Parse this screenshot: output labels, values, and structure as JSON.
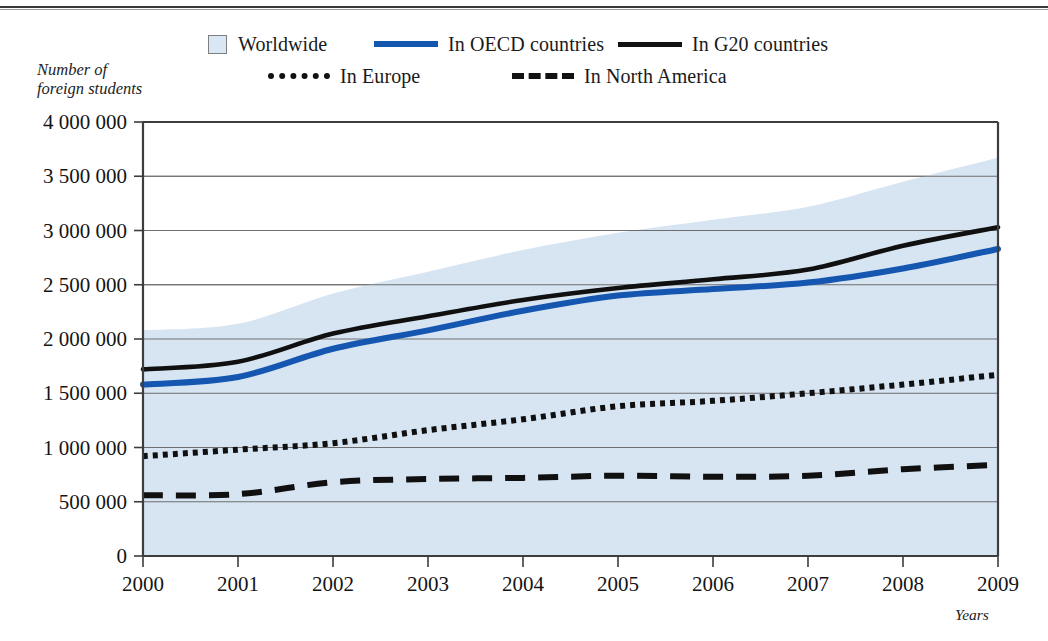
{
  "chart_data": {
    "type": "line",
    "title": "",
    "subtitle": "",
    "xlabel": "Years",
    "ylabel": "Number of\nforeign students",
    "ylabel_line1": "Number of",
    "ylabel_line2": "foreign students",
    "x": [
      2000,
      2001,
      2002,
      2003,
      2004,
      2005,
      2006,
      2007,
      2008,
      2009
    ],
    "xtick_labels": [
      "2000",
      "2001",
      "2002",
      "2003",
      "2004",
      "2005",
      "2006",
      "2007",
      "2008",
      "2009"
    ],
    "ylim": [
      0,
      4000000
    ],
    "ytick_values": [
      0,
      500000,
      1000000,
      1500000,
      2000000,
      2500000,
      3000000,
      3500000,
      4000000
    ],
    "ytick_labels": [
      "0",
      "500 000",
      "1 000 000",
      "1 500 000",
      "2 000 000",
      "2 500 000",
      "3 000 000",
      "3 500 000",
      "4 000 000"
    ],
    "grid": true,
    "legend_position": "top",
    "series": [
      {
        "name": "Worldwide",
        "style": "area-band",
        "color": "#d7e5f3",
        "values": [
          2080000,
          2140000,
          2420000,
          2620000,
          2820000,
          2980000,
          3100000,
          3220000,
          3450000,
          3670000
        ]
      },
      {
        "name": "In OECD countries",
        "style": "solid",
        "color": "#1557b0",
        "values": [
          1580000,
          1650000,
          1910000,
          2080000,
          2260000,
          2400000,
          2460000,
          2520000,
          2650000,
          2830000
        ]
      },
      {
        "name": "In G20 countries",
        "style": "solid",
        "color": "#101010",
        "values": [
          1720000,
          1790000,
          2050000,
          2210000,
          2360000,
          2470000,
          2550000,
          2640000,
          2860000,
          3030000
        ]
      },
      {
        "name": "In Europe",
        "style": "dotted",
        "color": "#101010",
        "values": [
          920000,
          980000,
          1040000,
          1160000,
          1260000,
          1380000,
          1430000,
          1500000,
          1580000,
          1670000
        ]
      },
      {
        "name": "In North America",
        "style": "dashed",
        "color": "#101010",
        "values": [
          560000,
          570000,
          680000,
          710000,
          720000,
          740000,
          730000,
          740000,
          800000,
          840000
        ]
      }
    ]
  },
  "legend": {
    "items": [
      {
        "label": "Worldwide",
        "marker": "filled-square-swatch"
      },
      {
        "label": "In OECD countries",
        "marker": "solid-blue-line-swatch"
      },
      {
        "label": "In G20 countries",
        "marker": "solid-black-line-swatch"
      },
      {
        "label": "In Europe",
        "marker": "dotted-black-line-swatch"
      },
      {
        "label": "In North America",
        "marker": "dashed-black-line-swatch"
      }
    ]
  },
  "colors": {
    "band": "#d7e5f3",
    "oecd": "#1557b0",
    "black": "#101010",
    "grid": "#6e6e6e",
    "axis": "#3d3d3d"
  }
}
